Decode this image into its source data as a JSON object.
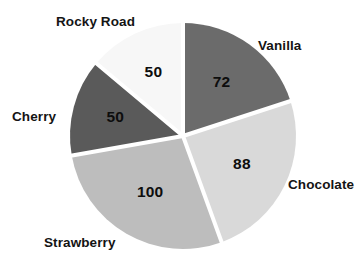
{
  "chart_data": {
    "type": "pie",
    "title": "",
    "subtitle": "",
    "xlabel": "",
    "ylabel": "",
    "legend_position": "outside-labels",
    "grid": false,
    "total": 360,
    "start_angle_deg": 0,
    "direction": "clockwise",
    "categories": [
      "Vanilla",
      "Chocolate",
      "Strawberry",
      "Cherry",
      "Rocky Road"
    ],
    "values": [
      72,
      88,
      100,
      50,
      50
    ],
    "slices": [
      {
        "label": "Vanilla",
        "value": 72,
        "value_text": "72",
        "color": "#6b6b6b",
        "start_deg": 0,
        "end_deg": 72,
        "label_side": "right"
      },
      {
        "label": "Chocolate",
        "value": 88,
        "value_text": "88",
        "color": "#d9d9d9",
        "start_deg": 72,
        "end_deg": 160,
        "label_side": "right"
      },
      {
        "label": "Strawberry",
        "value": 100,
        "value_text": "100",
        "color": "#bdbdbd",
        "start_deg": 160,
        "end_deg": 260,
        "label_side": "left"
      },
      {
        "label": "Cherry",
        "value": 50,
        "value_text": "50",
        "color": "#5a5a5a",
        "start_deg": 260,
        "end_deg": 310,
        "label_side": "left"
      },
      {
        "label": "Rocky Road",
        "value": 50,
        "value_text": "50",
        "color": "#f7f7f7",
        "start_deg": 310,
        "end_deg": 360,
        "label_side": "top"
      }
    ],
    "colors": {
      "background": "#ffffff",
      "slice_separator": "#ffffff",
      "value_text": "#0d0d0d",
      "category_text": "#141414"
    },
    "geometry": {
      "center_x": 183,
      "center_y": 136,
      "radius": 113,
      "separator_width": 4
    }
  }
}
